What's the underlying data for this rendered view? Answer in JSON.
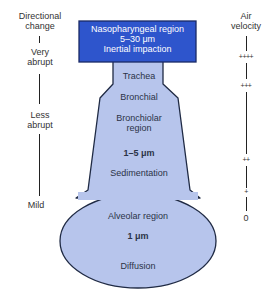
{
  "diagram": {
    "colors": {
      "nasopharyngeal_fill": "#2e55cc",
      "airway_fill": "#b7c5ec",
      "outline": "#1f2a44",
      "text_white": "#ffffff",
      "text_dark": "#2b3347"
    },
    "left_axis": {
      "title_line1": "Directional",
      "title_line2": "change",
      "levels": [
        {
          "line1": "Very",
          "line2": "abrupt"
        },
        {
          "line1": "Less",
          "line2": "abrupt"
        },
        {
          "line1": "Mild",
          "line2": ""
        }
      ]
    },
    "right_axis": {
      "title_line1": "Air",
      "title_line2": "velocity",
      "marks": [
        "++++",
        "+++",
        "++",
        "+",
        "0"
      ]
    },
    "regions": {
      "nasopharyngeal": {
        "name": "Nasopharyngeal region",
        "size": "5–30 μm",
        "mechanism": "Inertial impaction"
      },
      "trachea": {
        "name": "Trachea"
      },
      "bronchial": {
        "name": "Bronchial"
      },
      "bronchiolar": {
        "name_line1": "Bronchiolar",
        "name_line2": "region",
        "size": "1–5 μm",
        "mechanism": "Sedimentation"
      },
      "alveolar": {
        "name": "Alveolar region",
        "size": "1 μm",
        "mechanism": "Diffusion"
      }
    }
  }
}
